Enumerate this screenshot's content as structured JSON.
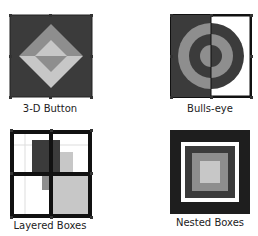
{
  "items": [
    {
      "label": "3-D Button"
    },
    {
      "label": "Bulls-eye"
    },
    {
      "label": "Layered Boxes"
    },
    {
      "label": "Nested Boxes"
    }
  ],
  "colors": {
    "dark": "#3a3a3a",
    "mid": "#8f8f8f",
    "light": "#c8c8c8",
    "white": "#ffffff",
    "black": "#111111"
  }
}
